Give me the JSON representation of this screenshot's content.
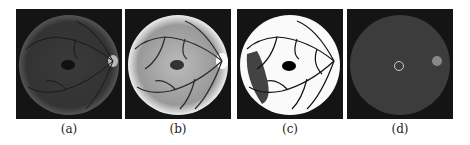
{
  "figure": {
    "panels": [
      {
        "id": "a",
        "caption": "(a)",
        "description": "original retinal fundus image, dark"
      },
      {
        "id": "b",
        "caption": "(b)",
        "description": "contrast-enhanced fundus image"
      },
      {
        "id": "c",
        "caption": "(c)",
        "description": "binarized vessel image"
      },
      {
        "id": "d",
        "caption": "(d)",
        "description": "fundus image with detected fovea circle"
      }
    ]
  }
}
